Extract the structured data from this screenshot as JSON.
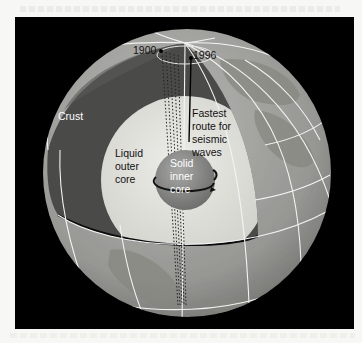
{
  "figure": {
    "colors": {
      "background": "#000000",
      "globe_surface": "#9a9a9a",
      "mantle": "#4a4a4a",
      "outer_core": "#dcdcd6",
      "inner_core": "#8a8a8a",
      "grid_lines": "#f2f2f2"
    },
    "labels": {
      "year_1900": "1900",
      "year_1996": "1996",
      "crust": "Crust",
      "fastest_line1": "Fastest",
      "fastest_line2": "route for",
      "fastest_line3": "seismic",
      "fastest_line4": "waves",
      "liquid_line1": "Liquid",
      "liquid_line2": "outer",
      "liquid_line3": "core",
      "solid_line1": "Solid",
      "solid_line2": "inner",
      "solid_line3": "core"
    }
  }
}
